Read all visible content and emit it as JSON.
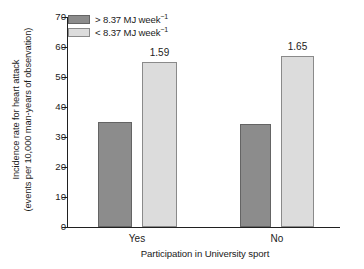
{
  "chart_data": {
    "type": "bar",
    "title": "",
    "categories": [
      "Yes",
      "No"
    ],
    "series": [
      {
        "name": "> 8.37 MJ week⁻¹",
        "values": [
          35,
          34.5
        ],
        "color": "#8c8c8c"
      },
      {
        "name": "< 8.37 MJ week⁻¹",
        "values": [
          55,
          57
        ],
        "color": "#dcdcdc"
      }
    ],
    "annotations": [
      "1.59",
      "1.65"
    ],
    "xlabel": "Participation in University sport",
    "ylabel": "Incidence rate for heart attack (events per 10,000 man-years of observation)",
    "ylabel_line1": "Incidence rate for heart attack",
    "ylabel_line2": "(events per 10,000 man-years of observation)",
    "ylim": [
      0,
      70
    ],
    "ytick_values": [
      0,
      10,
      20,
      30,
      40,
      50,
      60,
      70
    ],
    "ytick_labels": [
      "0",
      "10",
      "20",
      "30",
      "40",
      "50",
      "60",
      "70"
    ],
    "grid": false,
    "legend_position": "top-left"
  },
  "legend": {
    "items": [
      {
        "prefix": "> 8.37 MJ week",
        "exponent": "−1",
        "swatch": "dark"
      },
      {
        "prefix": "< 8.37 MJ week",
        "exponent": "−1",
        "swatch": "light"
      }
    ]
  },
  "axes": {
    "x_title": "Participation in University sport",
    "y_title_line1": "Incidence rate for heart attack",
    "y_title_line2": "(events per 10,000 man-years of observation)",
    "y_ticks": [
      "70",
      "60",
      "50",
      "40",
      "30",
      "20",
      "10",
      "0"
    ],
    "x_categories": [
      "Yes",
      "No"
    ]
  },
  "bars": [
    {
      "group": "Yes",
      "series": "> 8.37 MJ week⁻¹",
      "value": 35,
      "label": ""
    },
    {
      "group": "Yes",
      "series": "< 8.37 MJ week⁻¹",
      "value": 55,
      "label": "1.59"
    },
    {
      "group": "No",
      "series": "> 8.37 MJ week⁻¹",
      "value": 34.5,
      "label": ""
    },
    {
      "group": "No",
      "series": "< 8.37 MJ week⁻¹",
      "value": 57,
      "label": "1.65"
    }
  ]
}
